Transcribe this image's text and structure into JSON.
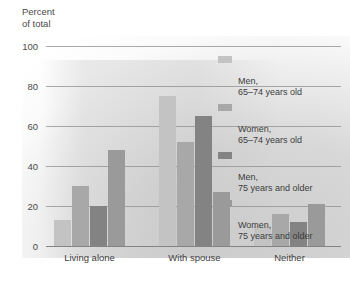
{
  "chart_data": {
    "type": "bar",
    "title": "",
    "ylabel": "Percent\nof total",
    "xlabel": "",
    "ylim": [
      0,
      100
    ],
    "yticks": [
      0,
      20,
      40,
      60,
      80,
      100
    ],
    "grid": true,
    "legend_position": "right",
    "categories": [
      "Living alone",
      "With spouse",
      "Neither"
    ],
    "series": [
      {
        "name": "Men,\n65–74 years old",
        "color": "#c3c3c3",
        "values": [
          13,
          75,
          10
        ]
      },
      {
        "name": "Women,\n65–74 years old",
        "color": "#a8a8a8",
        "values": [
          30,
          52,
          16
        ]
      },
      {
        "name": "Men,\n75 years and older",
        "color": "#838383",
        "values": [
          20,
          65,
          12
        ]
      },
      {
        "name": "Women,\n75 years and older",
        "color": "#9a9a9a",
        "values": [
          48,
          27,
          21
        ]
      }
    ]
  },
  "axis": {
    "y_label_text": "Percent\nof total",
    "tick_100": "100",
    "tick_80": "80",
    "tick_60": "60",
    "tick_40": "40",
    "tick_20": "20",
    "tick_0": "0"
  },
  "categories": {
    "c0": "Living alone",
    "c1": "With spouse",
    "c2": "Neither"
  },
  "legend": {
    "e0": "Men,\n65–74 years old",
    "e1": "Women,\n65–74 years old",
    "e2": "Men,\n75 years and older",
    "e3": "Women,\n75 years and older"
  }
}
